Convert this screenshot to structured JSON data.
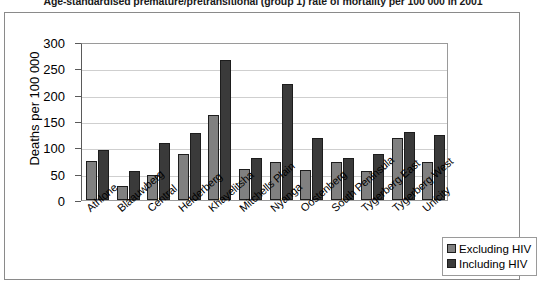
{
  "chart_data": {
    "type": "bar",
    "title": "Age-standardised premature/pretransitional (group 1) rate of mortality per 100 000 in 2001",
    "xlabel": "",
    "ylabel": "Deaths per 100 000",
    "ylim": [
      0,
      300
    ],
    "ytick_step": 50,
    "yticks": [
      300,
      250,
      200,
      150,
      100,
      50,
      0
    ],
    "grid": true,
    "legend_position": "bottom-right",
    "categories": [
      "Athlone",
      "Blaauwberg",
      "Central",
      "Helderberg",
      "Khayelitsha",
      "Mitchells Plain",
      "Nyanga",
      "Oostenberg",
      "South Peninsula",
      "Tygerberg East",
      "Tygerberg West",
      "Unicity"
    ],
    "series": [
      {
        "name": "Excluding HIV",
        "color": "#808080",
        "values": [
          75,
          27,
          48,
          87,
          162,
          58,
          72,
          57,
          73,
          56,
          117,
          72
        ]
      },
      {
        "name": "Including HIV",
        "color": "#3a3a3a",
        "values": [
          95,
          55,
          108,
          127,
          265,
          80,
          220,
          118,
          80,
          88,
          129,
          124
        ]
      }
    ]
  }
}
